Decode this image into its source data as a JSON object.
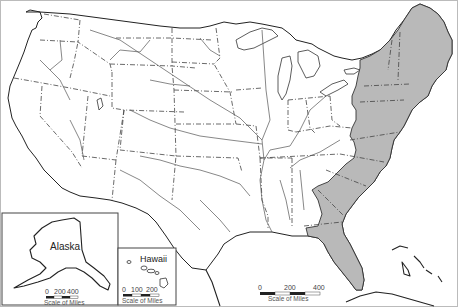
{
  "map": {
    "title": "United States outline map",
    "highlighted_region": "Atlantic seaboard / eastern states",
    "highlight_color": "#b9b9b9",
    "outline_color": "#222222",
    "background_color": "#ffffff"
  },
  "insets": {
    "alaska": {
      "label": "Alaska",
      "scale": {
        "ticks": [
          "0",
          "200",
          "400"
        ],
        "caption": "Scale of Miles"
      }
    },
    "hawaii": {
      "label": "Hawaii",
      "scale": {
        "ticks": [
          "0",
          "100",
          "200"
        ],
        "caption": "Scale of Miles"
      }
    }
  },
  "main_scale": {
    "ticks": [
      "0",
      "200",
      "400"
    ],
    "caption": "Scale of Miles"
  }
}
